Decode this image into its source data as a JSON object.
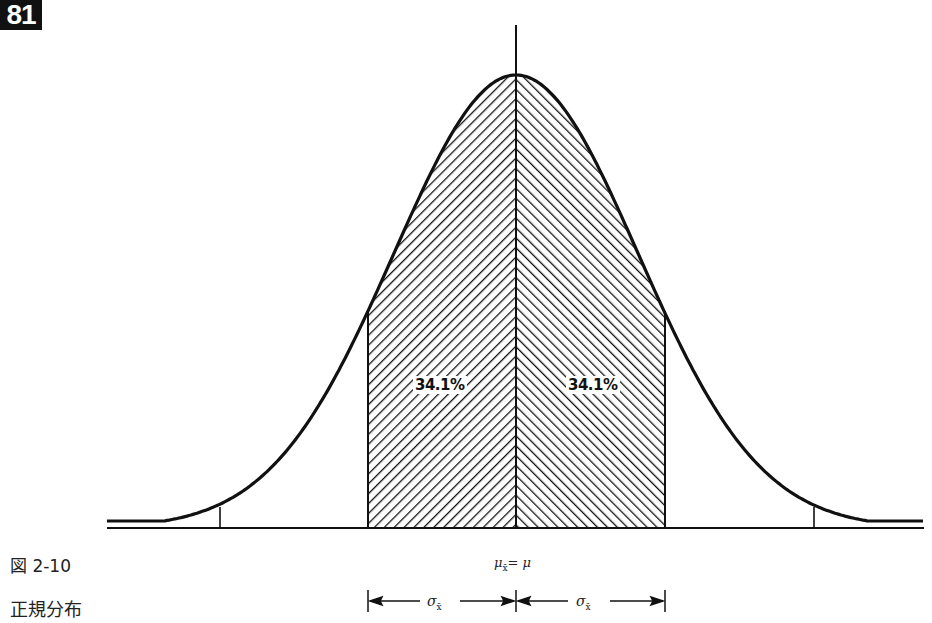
{
  "page_number": "81",
  "figure": {
    "label": "図 2-10",
    "title": "正規分布"
  },
  "annotations": {
    "left_area_pct": "34.1%",
    "right_area_pct": "34.1%",
    "mean_label_mu": "μ",
    "mean_label_sub": "x̄",
    "mean_label_rest": "= μ",
    "sigma_left": "σ",
    "sigma_left_sub": "x̄",
    "sigma_right": "σ",
    "sigma_right_sub": "x̄"
  },
  "colors": {
    "ink": "#111111",
    "background": "#ffffff"
  },
  "chart_data": {
    "type": "area",
    "title": "正規分布",
    "figure_number": "図 2-10",
    "xlabel": "μx̄ = μ",
    "ylabel": "",
    "x_ticks": [
      "-2σx̄",
      "-1σx̄",
      "μx̄ = μ",
      "+1σx̄",
      "+2σx̄"
    ],
    "x_tick_values": [
      -2,
      -1,
      0,
      1,
      2
    ],
    "xlim": [
      -2.75,
      2.75
    ],
    "grid": false,
    "legend": null,
    "series": [
      {
        "name": "normal density",
        "shape": "bell curve",
        "x": [
          -2.75,
          -2,
          -1.5,
          -1,
          -0.5,
          0,
          0.5,
          1,
          1.5,
          2,
          2.75
        ],
        "y_relative": [
          0.01,
          0.12,
          0.25,
          0.48,
          0.83,
          1.0,
          0.83,
          0.48,
          0.25,
          0.12,
          0.01
        ]
      }
    ],
    "shaded_regions": [
      {
        "from": -1,
        "to": 0,
        "label": "34.1%",
        "value": 34.1,
        "hatch": "backslash"
      },
      {
        "from": 0,
        "to": 1,
        "label": "34.1%",
        "value": 34.1,
        "hatch": "slash"
      }
    ],
    "brackets": [
      {
        "from": -1,
        "to": 0,
        "label": "σx̄"
      },
      {
        "from": 0,
        "to": 1,
        "label": "σx̄"
      }
    ]
  }
}
